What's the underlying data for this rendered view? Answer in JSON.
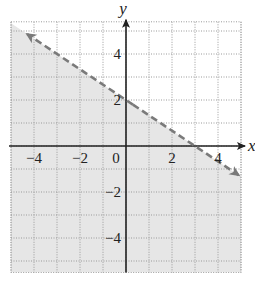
{
  "chart_data": {
    "type": "line",
    "title": "",
    "xlabel": "x",
    "ylabel": "y",
    "xlim": [
      -5,
      5
    ],
    "ylim": [
      -5.5,
      5.4
    ],
    "grid": true,
    "grid_style": "dotted",
    "x_ticks": [
      -4,
      -2,
      0,
      2,
      4
    ],
    "y_ticks": [
      4,
      2,
      -2,
      -4
    ],
    "tick_labels": {
      "x": [
        "−4",
        "−2",
        "0",
        "2",
        "4"
      ],
      "y": [
        "4",
        "2",
        "−2",
        "−4"
      ]
    },
    "series": [
      {
        "name": "boundary line y = -2/3 x + 2",
        "style": "dashed",
        "slope": -0.6667,
        "y_intercept": 2,
        "x_intercept": 3,
        "arrows": "both",
        "x": [
          -4.3,
          4.9
        ],
        "y": [
          4.87,
          -1.27
        ]
      }
    ],
    "shaded_region": {
      "description": "half-plane below the dashed line",
      "inequality": "y < -2/3 x + 2",
      "equivalent": "2x + 3y < 6"
    },
    "legend": null
  },
  "colors": {
    "shade": "#e6e6e6",
    "grid": "#9a9a9a",
    "axis": "#222222",
    "line": "#7a7a7a",
    "background": "#ffffff"
  }
}
